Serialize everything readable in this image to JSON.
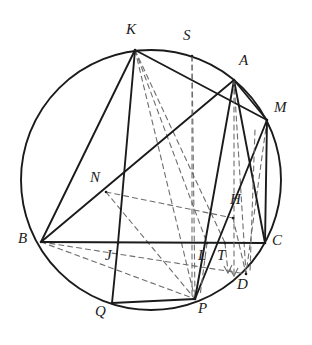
{
  "figure": {
    "kind": "geometric-diagram",
    "width": 312,
    "height": 345,
    "background_color": "#ffffff",
    "stroke_color": "#1b1b1b",
    "dashed_color": "#6e6e6e"
  },
  "circle": {
    "center_x": 151,
    "center_y": 180,
    "radius": 130,
    "label": "circumcircle"
  },
  "points": [
    {
      "id": "K",
      "label": "K",
      "x": 135,
      "y": 50,
      "label_x": 126,
      "label_y": 22,
      "on_circle": true
    },
    {
      "id": "S",
      "label": "S",
      "x": 192,
      "y": 56,
      "label_x": 183,
      "label_y": 28,
      "on_circle": true
    },
    {
      "id": "A",
      "label": "A",
      "x": 234,
      "y": 80,
      "label_x": 239,
      "label_y": 53,
      "on_circle": true
    },
    {
      "id": "M",
      "label": "M",
      "x": 267,
      "y": 120,
      "label_x": 274,
      "label_y": 100,
      "on_circle": true
    },
    {
      "id": "C",
      "label": "C",
      "x": 265,
      "y": 243,
      "label_x": 272,
      "label_y": 233,
      "on_circle": true
    },
    {
      "id": "D",
      "label": "D",
      "x": 246,
      "y": 274,
      "label_x": 237,
      "label_y": 277,
      "on_circle": true
    },
    {
      "id": "P",
      "label": "P",
      "x": 195,
      "y": 299,
      "label_x": 198,
      "label_y": 301,
      "on_circle": true
    },
    {
      "id": "Q",
      "label": "Q",
      "x": 112,
      "y": 303,
      "label_x": 95,
      "label_y": 304,
      "on_circle": true
    },
    {
      "id": "B",
      "label": "B",
      "x": 41,
      "y": 242,
      "label_x": 18,
      "label_y": 231,
      "on_circle": true
    },
    {
      "id": "N",
      "label": "N",
      "x": 106,
      "y": 192,
      "label_x": 90,
      "label_y": 170,
      "on_circle": false
    },
    {
      "id": "J",
      "label": "J",
      "x": 118,
      "y": 243,
      "label_x": 105,
      "label_y": 248,
      "on_circle": false
    },
    {
      "id": "L",
      "label": "L",
      "x": 207,
      "y": 243,
      "label_x": 198,
      "label_y": 248,
      "on_circle": false
    },
    {
      "id": "T",
      "label": "T",
      "x": 225,
      "y": 243,
      "label_x": 217,
      "label_y": 248,
      "on_circle": false
    },
    {
      "id": "H",
      "label": "H",
      "x": 233,
      "y": 218,
      "label_x": 230,
      "label_y": 192,
      "on_circle": false
    }
  ],
  "solid_segments": [
    {
      "name": "B-C",
      "from": "B",
      "to": "C"
    },
    {
      "name": "B-A",
      "from": "B",
      "to": "A"
    },
    {
      "name": "B-K",
      "from": "B",
      "to": "K"
    },
    {
      "name": "K-M",
      "from": "K",
      "to": "M"
    },
    {
      "name": "K-J",
      "from": "K",
      "to": "J"
    },
    {
      "name": "J-Q",
      "from": "J",
      "to": "Q"
    },
    {
      "name": "Q-P",
      "from": "Q",
      "to": "P"
    },
    {
      "name": "A-C",
      "from": "A",
      "to": "C"
    },
    {
      "name": "A-P",
      "from": "A",
      "to": "P"
    },
    {
      "name": "A-M",
      "from": "A",
      "to": "M"
    },
    {
      "name": "M-C",
      "from": "M",
      "to": "C"
    },
    {
      "name": "M-P",
      "from": "M",
      "to": "P"
    }
  ],
  "dashed_segments": [
    {
      "name": "K-P",
      "from": "K",
      "to": "P"
    },
    {
      "name": "K-L",
      "from": "K",
      "to": "L"
    },
    {
      "name": "K-T",
      "from": "K",
      "to": "T"
    },
    {
      "name": "S-P",
      "from": "S",
      "to": "P"
    },
    {
      "name": "N-P",
      "from": "N",
      "to": "P"
    },
    {
      "name": "B-P",
      "from": "B",
      "to": "P"
    },
    {
      "name": "B-D",
      "from": "B",
      "to": "D"
    },
    {
      "name": "A-D",
      "from": "A",
      "to": "D"
    },
    {
      "name": "M-D",
      "from": "M",
      "to": "D"
    },
    {
      "name": "H-D",
      "from": "H",
      "to": "D"
    },
    {
      "name": "N-H",
      "from": "N",
      "to": "H"
    }
  ]
}
